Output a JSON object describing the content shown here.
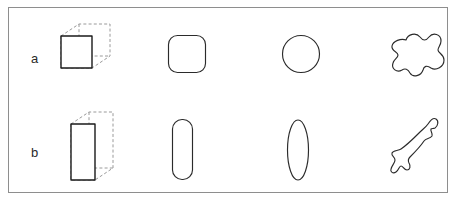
{
  "figure": {
    "frame": {
      "border_color": "#8e8e8e",
      "background_color": "#ffffff"
    },
    "rows": [
      {
        "id": "a",
        "label": "a",
        "description": "Cube and its two-dimensional equivalents",
        "shapes": [
          {
            "id": "a-cube",
            "name": "cube",
            "label": "cube",
            "style": "3d-wireframe",
            "front_face": "solid square",
            "hidden_edges": "dashed",
            "stroke_color": "#1a1a1a",
            "dashed_stroke_color": "#9a9a9a"
          },
          {
            "id": "a-rounded-square",
            "name": "rounded-square",
            "label": "rounded square",
            "style": "2d-outline",
            "stroke_color": "#2b2b2b"
          },
          {
            "id": "a-circle",
            "name": "circle",
            "label": "circle",
            "style": "2d-outline",
            "stroke_color": "#2b2b2b"
          },
          {
            "id": "a-blob",
            "name": "irregular-blob",
            "label": "irregular blob",
            "style": "2d-outline",
            "stroke_color": "#2b2b2b"
          }
        ]
      },
      {
        "id": "b",
        "label": "b",
        "description": "Elongated box and its two-dimensional equivalents",
        "shapes": [
          {
            "id": "b-prism",
            "name": "rectangular-prism",
            "label": "rectangular prism",
            "style": "3d-wireframe",
            "front_face": "solid tall rectangle",
            "hidden_edges": "dashed",
            "stroke_color": "#1a1a1a",
            "dashed_stroke_color": "#9a9a9a"
          },
          {
            "id": "b-rounded-rect",
            "name": "rounded-rectangle",
            "label": "rounded rectangle",
            "style": "2d-outline",
            "stroke_color": "#2b2b2b"
          },
          {
            "id": "b-ellipse",
            "name": "ellipse",
            "label": "ellipse",
            "style": "2d-outline",
            "stroke_color": "#2b2b2b"
          },
          {
            "id": "b-blob",
            "name": "elongated-irregular-blob",
            "label": "elongated irregular blob",
            "style": "2d-outline",
            "stroke_color": "#2b2b2b"
          }
        ]
      }
    ]
  }
}
